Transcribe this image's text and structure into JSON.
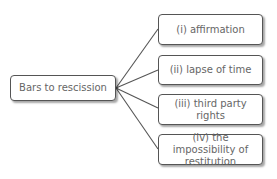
{
  "diagram": {
    "root": {
      "label": "Bars to rescission"
    },
    "children": [
      {
        "label": "(i) affirmation"
      },
      {
        "label": "(ii) lapse of time"
      },
      {
        "label": "(iii) third party rights"
      },
      {
        "label": "(iv) the impossibility of restitution"
      }
    ],
    "colors": {
      "border": "#555555",
      "text": "#666666",
      "connector": "#555555"
    }
  }
}
